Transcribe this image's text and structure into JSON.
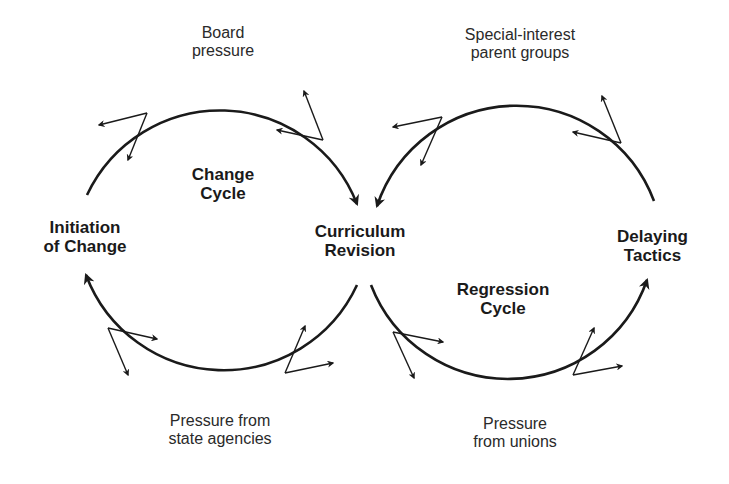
{
  "diagram": {
    "type": "two-cycle force diagram",
    "colors": {
      "line": "#1a1a1a",
      "text": "#1a1a1a",
      "background": "#ffffff"
    },
    "nodes": {
      "initiation": {
        "line1": "Initiation",
        "line2": "of Change"
      },
      "curriculum": {
        "line1": "Curriculum",
        "line2": "Revision"
      },
      "delaying": {
        "line1": "Delaying",
        "line2": "Tactics"
      }
    },
    "cycles": {
      "change": {
        "line1": "Change",
        "line2": "Cycle"
      },
      "regression": {
        "line1": "Regression",
        "line2": "Cycle"
      }
    },
    "pressures": {
      "board": {
        "line1": "Board",
        "line2": "pressure"
      },
      "parents": {
        "line1": "Special-interest",
        "line2": "parent groups"
      },
      "state": {
        "line1": "Pressure from",
        "line2": "state agencies"
      },
      "unions": {
        "line1": "Pressure",
        "line2": "from unions"
      }
    },
    "edges": [
      {
        "from": "Initiation of Change",
        "to": "Curriculum Revision",
        "via": "top of Change Cycle"
      },
      {
        "from": "Curriculum Revision",
        "to": "Initiation of Change",
        "via": "bottom of Change Cycle"
      },
      {
        "from": "Delaying Tactics",
        "to": "Curriculum Revision",
        "via": "top of Regression Cycle"
      },
      {
        "from": "Curriculum Revision",
        "to": "Delaying Tactics",
        "via": "bottom of Regression Cycle"
      }
    ]
  }
}
